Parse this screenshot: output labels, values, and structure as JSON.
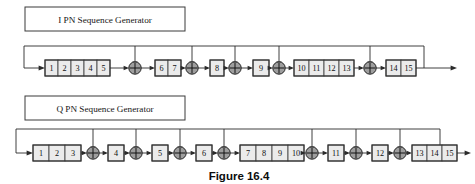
{
  "figure": {
    "caption": "Figure 16.4",
    "background_color": "#ffffff",
    "line_color": "#2b2b2b",
    "cell_fill": "#ebebeb",
    "adder_fill": "#9e9e9e"
  },
  "generators": [
    {
      "id": "i-pn",
      "title": "I PN Sequence Generator",
      "stage_count": 15,
      "adder_symbol": "XOR",
      "adder_count": 5,
      "groups": [
        {
          "cells": [
            "1",
            "2",
            "3",
            "4",
            "5"
          ]
        },
        {
          "cells": [
            "6",
            "7"
          ]
        },
        {
          "cells": [
            "8"
          ]
        },
        {
          "cells": [
            "9"
          ]
        },
        {
          "cells": [
            "10",
            "11",
            "12",
            "13"
          ]
        },
        {
          "cells": [
            "14",
            "15"
          ]
        }
      ]
    },
    {
      "id": "q-pn",
      "title": "Q PN Sequence Generator",
      "stage_count": 15,
      "adder_symbol": "XOR",
      "adder_count": 7,
      "groups": [
        {
          "cells": [
            "1",
            "2",
            "3"
          ]
        },
        {
          "cells": [
            "4"
          ]
        },
        {
          "cells": [
            "5"
          ]
        },
        {
          "cells": [
            "6"
          ]
        },
        {
          "cells": [
            "7",
            "8",
            "9",
            "10"
          ]
        },
        {
          "cells": [
            "11"
          ]
        },
        {
          "cells": [
            "12"
          ]
        },
        {
          "cells": [
            "13",
            "14",
            "15"
          ]
        }
      ]
    }
  ]
}
